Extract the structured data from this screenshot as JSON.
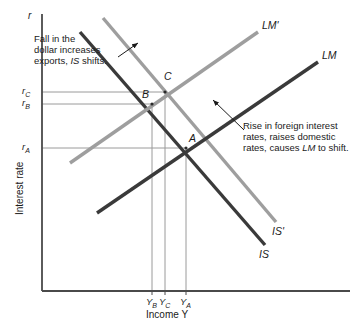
{
  "figure": {
    "type": "economics-is-lm-diagram",
    "axes": {
      "y_var": "r",
      "y_title": "Interest rate",
      "x_title": "Income Y",
      "y_ticks": [
        {
          "label": "r",
          "sub": "C",
          "y": 92
        },
        {
          "label": "r",
          "sub": "B",
          "y": 104
        },
        {
          "label": "r",
          "sub": "A",
          "y": 148
        }
      ],
      "x_ticks": [
        {
          "label": "Y",
          "sub": "B",
          "x": 152
        },
        {
          "label": "Y",
          "sub": "C",
          "x": 165
        },
        {
          "label": "Y",
          "sub": "A",
          "x": 186
        }
      ]
    },
    "curves": [
      {
        "name": "IS",
        "label": "IS",
        "color": "#3a3a3a",
        "x1": 80,
        "y1": 32,
        "x2": 265,
        "y2": 245,
        "label_x": 259,
        "label_y": 248
      },
      {
        "name": "IS-prime",
        "label": "IS'",
        "color": "#9e9e9e",
        "x1": 103,
        "y1": 18,
        "x2": 276,
        "y2": 222,
        "label_x": 272,
        "label_y": 225
      },
      {
        "name": "LM",
        "label": "LM",
        "color": "#3a3a3a",
        "x1": 97,
        "y1": 213,
        "x2": 318,
        "y2": 62,
        "label_x": 322,
        "label_y": 49
      },
      {
        "name": "LM-prime",
        "label": "LM'",
        "color": "#9e9e9e",
        "x1": 70,
        "y1": 163,
        "x2": 258,
        "y2": 32,
        "label_x": 262,
        "label_y": 19
      }
    ],
    "points": [
      {
        "name": "A",
        "label": "A",
        "x": 186,
        "y": 148,
        "label_x": 189,
        "label_y": 132
      },
      {
        "name": "B",
        "label": "B",
        "x": 152,
        "y": 104,
        "label_x": 142,
        "label_y": 88
      },
      {
        "name": "C",
        "label": "C",
        "x": 165,
        "y": 92,
        "label_x": 164,
        "label_y": 70
      }
    ],
    "annotations": [
      {
        "name": "is-shift-annotation",
        "lines": [
          [
            {
              "t": "Fall in the",
              "em": false
            }
          ],
          [
            {
              "t": "dollar increases",
              "em": false
            }
          ],
          [
            {
              "t": "exports, ",
              "em": false
            },
            {
              "t": "IS",
              "em": true
            },
            {
              "t": " shifts.",
              "em": false
            }
          ]
        ],
        "x": 34,
        "y": 33,
        "arrow": {
          "x1": 118,
          "y1": 57,
          "x2": 138,
          "y2": 43
        }
      },
      {
        "name": "lm-shift-annotation",
        "lines": [
          [
            {
              "t": "Rise in foreign interest",
              "em": false
            }
          ],
          [
            {
              "t": "rates, raises domestic",
              "em": false
            }
          ],
          [
            {
              "t": "rates, causes ",
              "em": false
            },
            {
              "t": "LM",
              "em": true
            },
            {
              "t": " to shift.",
              "em": false
            }
          ]
        ],
        "x": 243,
        "y": 120,
        "arrow": {
          "x1": 244,
          "y1": 130,
          "x2": 213,
          "y2": 100
        }
      }
    ],
    "colors": {
      "dark_curve": "#3a3a3a",
      "light_curve": "#9e9e9e",
      "axis": "#4a4a4a",
      "guide": "#9a9a9a",
      "text": "#1a1a1a"
    },
    "geometry": {
      "plot_left": 42,
      "plot_right": 350,
      "plot_top": 14,
      "plot_bottom": 291
    }
  }
}
